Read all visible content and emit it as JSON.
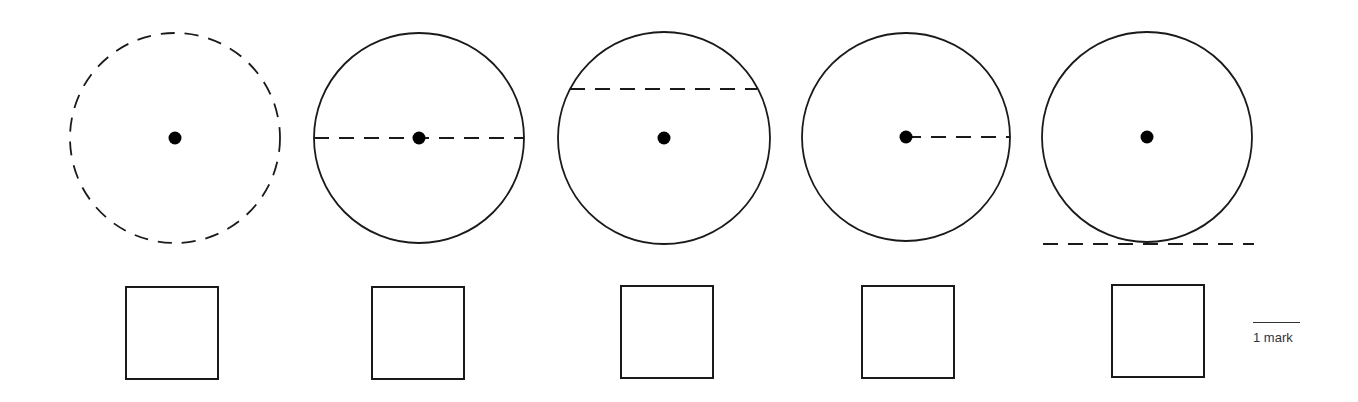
{
  "figures": [
    {
      "id": "circle-1",
      "feature": "circumference",
      "cx": 175,
      "cy": 138,
      "r": 105,
      "circle_dashed": true,
      "line": null
    },
    {
      "id": "circle-2",
      "feature": "diameter",
      "cx": 419,
      "cy": 138,
      "r": 105,
      "circle_dashed": false,
      "line": {
        "x1": 314,
        "y1": 138,
        "x2": 524,
        "y2": 138
      }
    },
    {
      "id": "circle-3",
      "feature": "chord",
      "cx": 664,
      "cy": 138,
      "r": 106,
      "circle_dashed": false,
      "line": {
        "x1": 570,
        "y1": 89,
        "x2": 757,
        "y2": 89
      }
    },
    {
      "id": "circle-4",
      "feature": "radius",
      "cx": 906,
      "cy": 137,
      "r": 104,
      "circle_dashed": false,
      "line": {
        "x1": 906,
        "y1": 137,
        "x2": 1010,
        "y2": 137
      }
    },
    {
      "id": "circle-5",
      "feature": "tangent",
      "cx": 1147,
      "cy": 137,
      "r": 105,
      "circle_dashed": false,
      "line": {
        "x1": 1043,
        "y1": 244,
        "x2": 1254,
        "y2": 244
      }
    }
  ],
  "answer_boxes": [
    {
      "left": 125,
      "top": 286
    },
    {
      "left": 371,
      "top": 286
    },
    {
      "left": 620,
      "top": 285
    },
    {
      "left": 861,
      "top": 285
    },
    {
      "left": 1111,
      "top": 284
    }
  ],
  "marks": {
    "label": "1 mark"
  },
  "colors": {
    "stroke": "#1a1a1a",
    "background": "#ffffff"
  }
}
